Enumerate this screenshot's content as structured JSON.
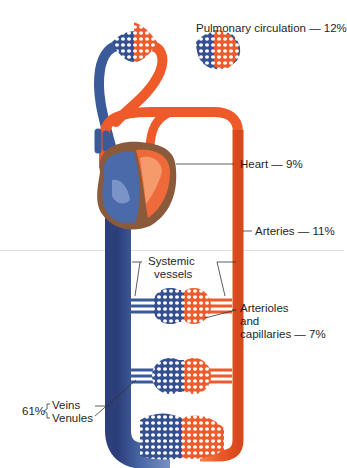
{
  "colors": {
    "oxygenated": "#ee5a2a",
    "oxygenated_light": "#f58a5a",
    "deoxygenated": "#3a5a9a",
    "deoxygenated_dark": "#2c3f7a",
    "heart_muscle": "#8a5a3a",
    "label_line": "#333333"
  },
  "labels": {
    "pulmonary": "Pulmonary circulation — 12%",
    "heart": "Heart — 9%",
    "arteries": "Arteries — 11%",
    "systemic_line1": "Systemic",
    "systemic_line2": "vessels",
    "arterioles_line1": "Arterioles",
    "arterioles_line2": "and",
    "arterioles_line3": "capillaries — 7%",
    "veins_percent": "61%",
    "veins": "Veins",
    "venules": "Venules"
  },
  "components": [
    {
      "name": "Pulmonary circulation",
      "percent": 12
    },
    {
      "name": "Heart",
      "percent": 9
    },
    {
      "name": "Arteries",
      "percent": 11
    },
    {
      "name": "Arterioles and capillaries",
      "percent": 7
    },
    {
      "name": "Veins and Venules",
      "percent": 61
    }
  ]
}
